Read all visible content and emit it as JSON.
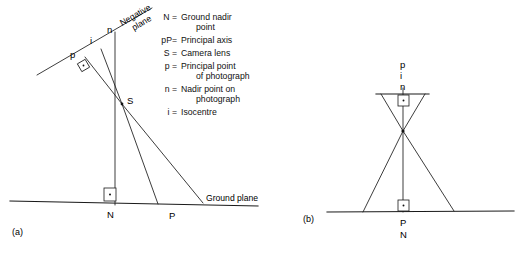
{
  "figure": {
    "caption_a": "(a)",
    "caption_b": "(b)",
    "negative_plane_label_line1": "Negative",
    "negative_plane_label_line2": "plane",
    "ground_plane_label": "Ground plane"
  },
  "legend": {
    "entries": [
      {
        "symbol": "N =",
        "text_line1": "Ground nadir",
        "text_line2": "point"
      },
      {
        "symbol": "pP=",
        "text_line1": "Principal axis",
        "text_line2": ""
      },
      {
        "symbol": "S =",
        "text_line1": "Camera lens",
        "text_line2": ""
      },
      {
        "symbol": "p =",
        "text_line1": "Principal point",
        "text_line2": "of photograph"
      },
      {
        "symbol": "n =",
        "text_line1": "Nadir point on",
        "text_line2": "photograph"
      },
      {
        "symbol": "i =",
        "text_line1": "Isocentre",
        "text_line2": ""
      }
    ]
  },
  "diagram_a": {
    "point_p": "p",
    "point_i": "i",
    "point_n": "n",
    "point_S": "S",
    "point_N": "N",
    "point_P": "P"
  },
  "diagram_b": {
    "point_p": "p",
    "point_i": "i",
    "point_n": "n",
    "point_P": "P",
    "point_N": "N"
  },
  "colors": {
    "ink": "#1a1a1a",
    "background": "#ffffff"
  }
}
